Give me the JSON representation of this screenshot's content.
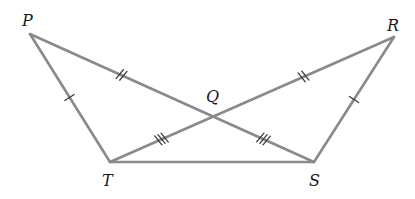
{
  "diagram": {
    "type": "geometry",
    "line_color": "#8a8a8a",
    "tick_color": "#3a3a3a",
    "label_color": "#1a1a1a",
    "vertices": {
      "P": {
        "label": "P",
        "x": 30,
        "y": 34
      },
      "R": {
        "label": "R",
        "x": 394,
        "y": 37
      },
      "Q": {
        "label": "Q",
        "x": 213,
        "y": 116
      },
      "T": {
        "label": "T",
        "x": 110,
        "y": 162
      },
      "S": {
        "label": "S",
        "x": 314,
        "y": 162
      }
    },
    "segments": [
      {
        "name": "PT",
        "from": "P",
        "to": "T",
        "ticks": 1
      },
      {
        "name": "RS",
        "from": "R",
        "to": "S",
        "ticks": 1
      },
      {
        "name": "PQ",
        "from": "P",
        "to": "Q",
        "ticks": 2
      },
      {
        "name": "QR",
        "from": "Q",
        "to": "R",
        "ticks": 2
      },
      {
        "name": "TQ",
        "from": "T",
        "to": "Q",
        "ticks": 3
      },
      {
        "name": "QS",
        "from": "Q",
        "to": "S",
        "ticks": 3
      },
      {
        "name": "TS",
        "from": "T",
        "to": "S",
        "ticks": 0
      }
    ],
    "congruence_marks": {
      "single": [
        "PT",
        "RS"
      ],
      "double": [
        "PQ",
        "QR"
      ],
      "triple": [
        "TQ",
        "QS"
      ]
    }
  }
}
